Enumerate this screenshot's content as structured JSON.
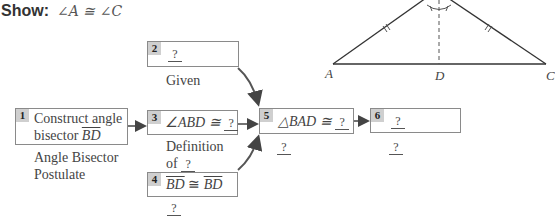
{
  "show": {
    "label": "Show:",
    "expression": "∠A ≅ ∠C"
  },
  "steps": [
    {
      "number": "1",
      "statement_line1": "Construct angle",
      "statement_line2_prefix": "bisector ",
      "statement_line2_segment": "BD",
      "reason_line1": "Angle Bisector",
      "reason_line2": "Postulate"
    },
    {
      "number": "2",
      "statement_blank": "?",
      "reason": "Given"
    },
    {
      "number": "3",
      "statement_prefix": "∠ABD ≅ ",
      "statement_blank": "?",
      "reason_line1": "Definition",
      "reason_line2_prefix": "of ",
      "reason_blank": "?"
    },
    {
      "number": "4",
      "statement_seg1": "BD",
      "statement_op": " ≅ ",
      "statement_seg2": "BD",
      "reason_blank": "?"
    },
    {
      "number": "5",
      "statement_prefix": "△BAD ≅ ",
      "statement_blank": "?",
      "reason_blank": "?"
    },
    {
      "number": "6",
      "statement_blank": "?",
      "reason_blank": "?"
    }
  ],
  "figure": {
    "vertex_A": "A",
    "vertex_D": "D",
    "vertex_C": "C"
  },
  "colors": {
    "box_border": "#8a8a8a",
    "number_badge": "#cfcfcf",
    "arrow": "#444444",
    "text": "#444444"
  }
}
